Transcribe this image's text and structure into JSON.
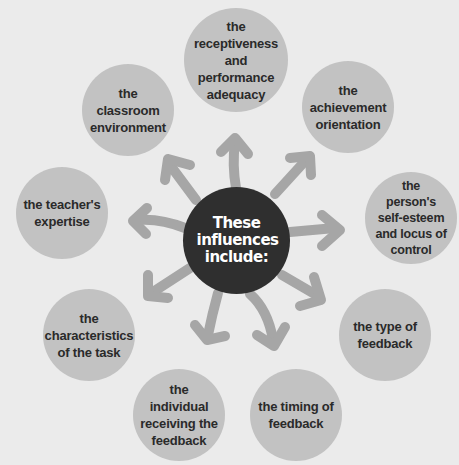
{
  "diagram": {
    "center": {
      "label": "These influences include:",
      "color": "#2f2f2f",
      "text_color": "#ffffff"
    },
    "node_color": "#c2c2c2",
    "arrow_color": "#a6a6a6",
    "background": "#ebebeb",
    "nodes": [
      {
        "label": "the receptiveness and performance adequacy",
        "lines": [
          "the",
          "receptiveness",
          "and performance",
          "adequacy"
        ]
      },
      {
        "label": "the achievement orientation",
        "lines": [
          "the",
          "achievement",
          "orientation"
        ]
      },
      {
        "label": "the person's self-esteem and locus of control",
        "lines": [
          "the",
          "person's",
          "self-esteem",
          "and locus of",
          "control"
        ]
      },
      {
        "label": "the type of feedback",
        "lines": [
          "the type of",
          "feedback"
        ]
      },
      {
        "label": "the timing of feedback",
        "lines": [
          "the timing of",
          "feedback"
        ]
      },
      {
        "label": "the individual receiving the feedback",
        "lines": [
          "the",
          "individual",
          "receiving the",
          "feedback"
        ]
      },
      {
        "label": "the characteristics of the task",
        "lines": [
          "the",
          "characteristics",
          "of the task"
        ]
      },
      {
        "label": "the teacher's expertise",
        "lines": [
          "the teacher's",
          "expertise"
        ]
      },
      {
        "label": "the classroom environment",
        "lines": [
          "the classroom",
          "environment"
        ]
      }
    ]
  }
}
